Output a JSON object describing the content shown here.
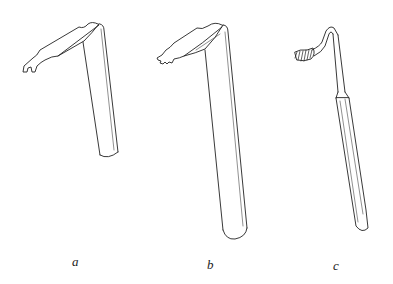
{
  "figure": {
    "instruments": [
      {
        "label": "a",
        "description": "retractor with notched two-prong blade, straight cylindrical shaft"
      },
      {
        "label": "b",
        "description": "retractor with toothed (rake) blade, straight cylindrical shaft with rounded end"
      },
      {
        "label": "c",
        "description": "hooked retractor with toothed rake tip, slim shank and tapered handle"
      }
    ],
    "colors": {
      "line": "#222222",
      "background": "#ffffff"
    }
  }
}
